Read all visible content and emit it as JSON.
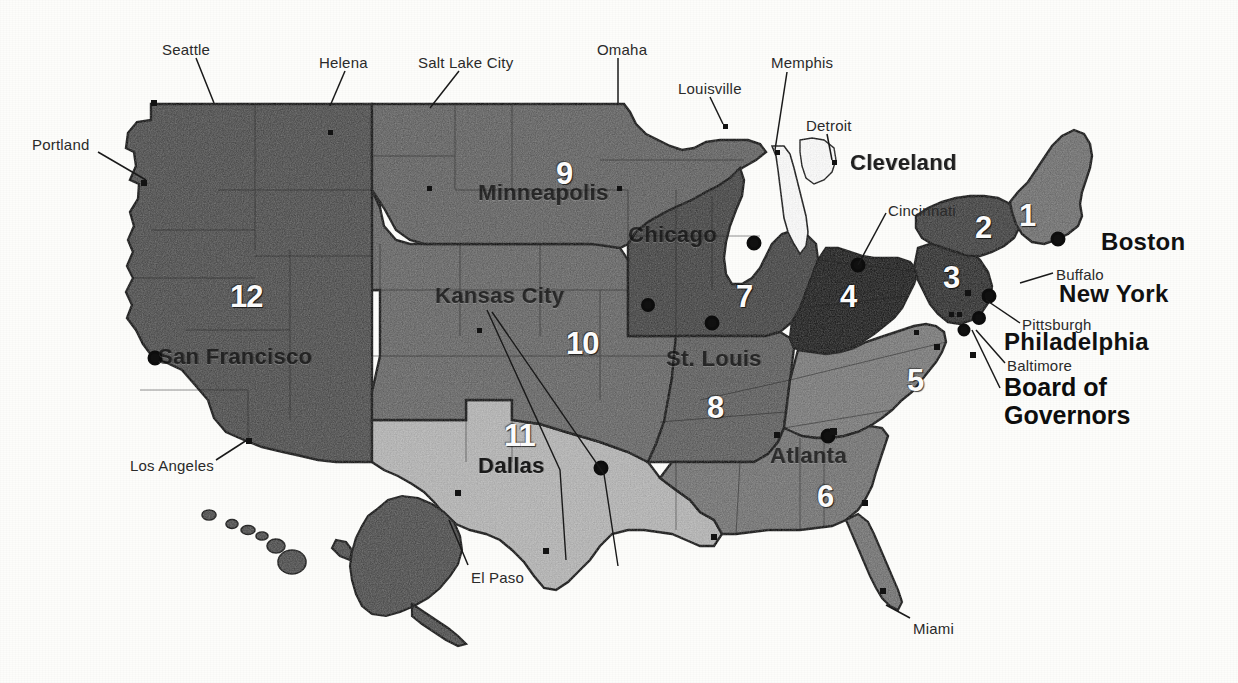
{
  "map": {
    "title": "Federal Reserve Districts and Reserve Bank Cities",
    "background_color": "#fdfdfb",
    "outline_color": "#141414"
  },
  "legend_colors": {
    "district_1": "#6d6d6d",
    "district_2": "#3d3d3d",
    "district_3": "#2b2b2b",
    "district_4": "#191919",
    "district_5": "#777777",
    "district_6": "#707070",
    "district_7": "#404040",
    "district_8": "#5a5a5a",
    "district_9": "#5f5f5f",
    "district_10": "#636363",
    "district_11": "#b4b4b4",
    "district_12": "#4a4a4a",
    "water": "#ffffff",
    "label_dark": "#111111",
    "label_light": "#fbfbfb"
  },
  "districts": [
    {
      "number": "1",
      "bank_city": "Boston",
      "x": 1019,
      "y": 200
    },
    {
      "number": "2",
      "bank_city": "New York",
      "x": 975,
      "y": 212
    },
    {
      "number": "3",
      "bank_city": "Philadelphia",
      "x": 943,
      "y": 262
    },
    {
      "number": "4",
      "bank_city": "Cleveland",
      "x": 840,
      "y": 281
    },
    {
      "number": "5",
      "bank_city": "Richmond",
      "x": 907,
      "y": 365
    },
    {
      "number": "6",
      "bank_city": "Atlanta",
      "x": 817,
      "y": 481
    },
    {
      "number": "7",
      "bank_city": "Chicago",
      "x": 736,
      "y": 281
    },
    {
      "number": "8",
      "bank_city": "St. Louis",
      "x": 707,
      "y": 392
    },
    {
      "number": "9",
      "bank_city": "Minneapolis",
      "x": 556,
      "y": 158
    },
    {
      "number": "10",
      "bank_city": "Kansas City",
      "x": 566,
      "y": 328
    },
    {
      "number": "11",
      "bank_city": "Dallas",
      "x": 504,
      "y": 420
    },
    {
      "number": "12",
      "bank_city": "San Francisco",
      "x": 230,
      "y": 281
    }
  ],
  "callout_cities": [
    {
      "name": "Seattle",
      "label_x": 162,
      "label_y": 42,
      "line": [
        196,
        58,
        214,
        103
      ]
    },
    {
      "name": "Helena",
      "label_x": 319,
      "label_y": 55,
      "line": [
        345,
        71,
        330,
        106
      ]
    },
    {
      "name": "Salt Lake City",
      "label_x": 418,
      "label_y": 55,
      "line": [
        459,
        71,
        430,
        108
      ]
    },
    {
      "name": "Omaha",
      "label_x": 597,
      "label_y": 42,
      "line": [
        618,
        58,
        618,
        103
      ]
    },
    {
      "name": "Louisville",
      "label_x": 678,
      "label_y": 81,
      "line": [
        710,
        97,
        723,
        124
      ]
    },
    {
      "name": "Memphis",
      "label_x": 771,
      "label_y": 55,
      "line": [
        787,
        72,
        775,
        150
      ]
    },
    {
      "name": "Detroit",
      "label_x": 806,
      "label_y": 118,
      "line": [
        827,
        134,
        832,
        160
      ]
    },
    {
      "name": "Cincinnati",
      "label_x": 888,
      "label_y": 203,
      "line": [
        886,
        213,
        858,
        265
      ]
    },
    {
      "name": "Buffalo",
      "label_x": 1056,
      "label_y": 267,
      "line": [
        1053,
        273,
        1020,
        283
      ]
    },
    {
      "name": "Pittsburgh",
      "label_x": 1022,
      "label_y": 317,
      "line": [
        1020,
        323,
        986,
        300
      ]
    },
    {
      "name": "Baltimore",
      "label_x": 1007,
      "label_y": 358,
      "line": [
        1005,
        363,
        976,
        330
      ]
    },
    {
      "name": "Portland",
      "label_x": 32,
      "label_y": 137,
      "line": [
        98,
        152,
        146,
        180
      ]
    },
    {
      "name": "Los Angeles",
      "label_x": 130,
      "label_y": 458,
      "line": [
        216,
        460,
        247,
        440
      ]
    },
    {
      "name": "El Paso",
      "label_x": 471,
      "label_y": 570,
      "line": [
        468,
        565,
        449,
        520
      ]
    },
    {
      "name": "Miami",
      "label_x": 913,
      "label_y": 621,
      "line": [
        910,
        618,
        886,
        605
      ]
    }
  ],
  "bank_labels_outside": [
    {
      "name": "Boston",
      "x": 1101,
      "y": 230,
      "size": "large"
    },
    {
      "name": "New York",
      "x": 1059,
      "y": 282,
      "size": "large"
    },
    {
      "name": "Philadelphia",
      "x": 1004,
      "y": 330,
      "size": "large"
    }
  ],
  "bank_labels_on_map": [
    {
      "name": "Cleveland",
      "x": 850,
      "y": 152,
      "dim": false
    },
    {
      "name": "Minneapolis",
      "x": 478,
      "y": 182,
      "dim": true
    },
    {
      "name": "Chicago",
      "x": 628,
      "y": 224,
      "dim": true
    },
    {
      "name": "Kansas City",
      "x": 435,
      "y": 285,
      "dim": true
    },
    {
      "name": "St. Louis",
      "x": 666,
      "y": 348,
      "dim": true
    },
    {
      "name": "San Francisco",
      "x": 158,
      "y": 346,
      "dim": true
    },
    {
      "name": "Dallas",
      "x": 478,
      "y": 455,
      "dim": false
    },
    {
      "name": "Atlanta",
      "x": 770,
      "y": 445,
      "dim": true
    }
  ],
  "board_of_governors": {
    "line1": "Board of",
    "line2": "Governors",
    "x": 1004,
    "y": 373,
    "leader_line": [
      1000,
      388,
      972,
      330
    ]
  },
  "insets": [
    {
      "name": "Alaska",
      "label": ""
    },
    {
      "name": "Hawaii",
      "label": ""
    }
  ]
}
